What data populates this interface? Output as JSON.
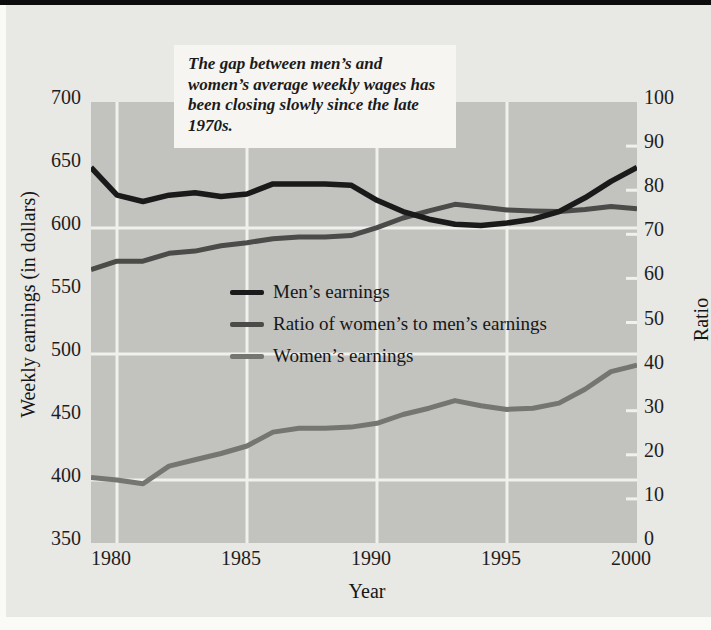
{
  "annotation": {
    "text": "The gap between men’s and women’s average weekly wages has been closing slowly since the late 1970s."
  },
  "colors": {
    "page_background": "#fafaf7",
    "panel_background": "#e8e8e5",
    "plot_background": "#c2c2bf",
    "gridline": "#f0f0ed",
    "top_rule": "#0d0d0d",
    "men_line": "#1a1a1a",
    "ratio_line": "#4b4b49",
    "women_line": "#757572"
  },
  "chart_data": {
    "type": "line",
    "xlabel": "Year",
    "ylabel_left": "Weekly earnings (in dollars)",
    "ylabel_right": "Ratio",
    "x": [
      1979,
      1980,
      1981,
      1982,
      1983,
      1984,
      1985,
      1986,
      1987,
      1988,
      1989,
      1990,
      1991,
      1992,
      1993,
      1994,
      1995,
      1996,
      1997,
      1998,
      1999,
      2000
    ],
    "series": [
      {
        "name": "Men’s earnings",
        "axis": "left",
        "color": "#1a1a1a",
        "stroke_width": 5.5,
        "values": [
          648,
          626,
          621,
          626,
          628,
          625,
          627,
          635,
          635,
          635,
          634,
          622,
          613,
          607,
          603,
          602,
          604,
          607,
          613,
          624,
          637,
          648
        ]
      },
      {
        "name": "Ratio of women’s to men’s earnings",
        "axis": "right",
        "color": "#4b4b49",
        "stroke_width": 5,
        "values": [
          62.0,
          63.9,
          63.9,
          65.7,
          66.2,
          67.4,
          68.1,
          69.0,
          69.4,
          69.4,
          69.7,
          71.5,
          73.7,
          75.3,
          76.8,
          76.2,
          75.5,
          75.3,
          75.2,
          75.6,
          76.3,
          75.8
        ]
      },
      {
        "name": "Women’s earnings",
        "axis": "left",
        "color": "#757572",
        "stroke_width": 5,
        "values": [
          402,
          400,
          397,
          411,
          416,
          421,
          427,
          438,
          441,
          441,
          442,
          445,
          452,
          457,
          463,
          459,
          456,
          457,
          461,
          472,
          486,
          491
        ]
      }
    ],
    "left_axis": {
      "min": 350,
      "max": 700,
      "ticks": [
        700,
        650,
        600,
        550,
        500,
        450,
        400,
        350
      ]
    },
    "right_axis": {
      "min": 0,
      "max": 100,
      "ticks": [
        100,
        90,
        80,
        70,
        60,
        50,
        40,
        30,
        20,
        10,
        0
      ]
    },
    "x_ticks": [
      1980,
      1985,
      1990,
      1995,
      2000
    ],
    "gridlines": {
      "vertical_years": [
        1980,
        1985,
        1990,
        1995
      ],
      "horizontal_left_values": [
        600,
        500,
        400
      ],
      "right_edge_tick_marks": [
        90,
        80,
        70,
        60,
        50,
        40,
        30,
        20,
        10
      ]
    },
    "legend_position": "inside-left-middle",
    "xlim": [
      1979,
      2000
    ]
  }
}
